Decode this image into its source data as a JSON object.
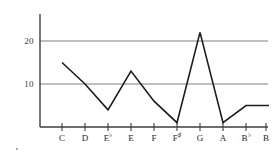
{
  "chart_data": {
    "type": "line",
    "title": "",
    "subtitle": "",
    "xlabel": "",
    "ylabel": "",
    "categories": [
      "C",
      "D",
      "E♭",
      "E",
      "F",
      "F♯",
      "G",
      "A",
      "B♭",
      "B"
    ],
    "category_parts": [
      {
        "letter": "C",
        "accidental": ""
      },
      {
        "letter": "D",
        "accidental": ""
      },
      {
        "letter": "E",
        "accidental": "♭"
      },
      {
        "letter": "E",
        "accidental": ""
      },
      {
        "letter": "F",
        "accidental": ""
      },
      {
        "letter": "F",
        "accidental": "♯"
      },
      {
        "letter": "G",
        "accidental": ""
      },
      {
        "letter": "A",
        "accidental": ""
      },
      {
        "letter": "B",
        "accidental": "♭"
      },
      {
        "letter": "B",
        "accidental": ""
      }
    ],
    "values": [
      15,
      10,
      4,
      13,
      6,
      1,
      22,
      1,
      5,
      5
    ],
    "series": [
      {
        "name": "",
        "values": [
          15,
          10,
          4,
          13,
          6,
          1,
          22,
          1,
          5,
          5
        ]
      }
    ],
    "ylim": [
      0,
      25
    ],
    "xlim": [
      0,
      10
    ],
    "yticks": [
      10,
      20
    ],
    "ytick_labels": [
      "10",
      "20"
    ],
    "grid": true,
    "grid_axis": "y",
    "legend": "none",
    "line_color": "#1c1c1c",
    "grid_color": "#808080",
    "axis_color": "#3d3d3d",
    "background": "#ffffff"
  },
  "axes": {
    "y_axis_name": "y-axis",
    "x_axis_name": "x-axis"
  },
  "artifacts": {
    "speck_label": "scan-speck"
  }
}
